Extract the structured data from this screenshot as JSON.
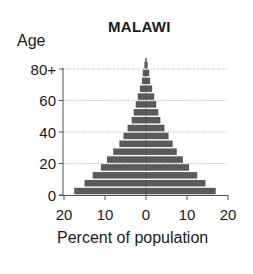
{
  "chart_data": {
    "type": "bar",
    "subtype": "population-pyramid",
    "title": "MALAWI",
    "ylabel": "Age",
    "xlabel": "Percent of population",
    "y_ticks": [
      "0",
      "20",
      "40",
      "60",
      "80+"
    ],
    "x_ticks": [
      "20",
      "10",
      "0",
      "10",
      "20"
    ],
    "xlim": [
      -20,
      20
    ],
    "grid": "horizontal dotted at 20, 40, 60, 80",
    "categories": [
      "0-4",
      "5-9",
      "10-14",
      "15-19",
      "20-24",
      "25-29",
      "30-34",
      "35-39",
      "40-44",
      "45-49",
      "50-54",
      "55-59",
      "60-64",
      "65-69",
      "70-74",
      "75-79",
      "80+"
    ],
    "series": [
      {
        "name": "Left (males)",
        "values": [
          17.5,
          15,
          13,
          11,
          9.5,
          8,
          6.5,
          5.5,
          4.5,
          3.5,
          3,
          2.5,
          2,
          1.5,
          1,
          0.8,
          0.4
        ]
      },
      {
        "name": "Right (females)",
        "values": [
          17,
          14.5,
          12.5,
          10.5,
          9,
          7.5,
          6.5,
          5.5,
          4.5,
          3.5,
          3,
          2.5,
          2,
          1.5,
          1,
          0.8,
          0.4
        ]
      }
    ],
    "bar_color": "#5a5a5a"
  },
  "labels": {
    "title": "MALAWI",
    "ylabel": "Age",
    "xlabel": "Percent of population",
    "y_ticks": [
      "0",
      "20",
      "40",
      "60",
      "80+"
    ],
    "x_ticks": [
      "20",
      "10",
      "0",
      "10",
      "20"
    ]
  }
}
